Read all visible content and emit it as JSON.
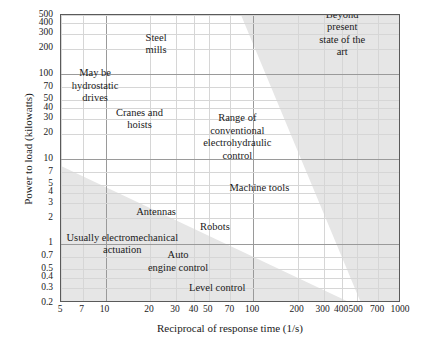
{
  "chart_data": {
    "type": "scatter",
    "title": "",
    "xlabel": "Reciprocal of response time (1/s)",
    "ylabel": "Power to load (kilowatts)",
    "xscale": "log",
    "yscale": "log",
    "xlim": [
      5,
      1000
    ],
    "ylim": [
      0.2,
      500
    ],
    "grid": true,
    "legend": "none",
    "xticks": [
      "5",
      "7",
      "10",
      "20",
      "30",
      "40",
      "50",
      "70",
      "100",
      "200",
      "300",
      "400",
      "500",
      "700",
      "1000"
    ],
    "xtick_values": [
      5,
      7,
      10,
      20,
      30,
      40,
      50,
      70,
      100,
      200,
      300,
      400,
      500,
      700,
      1000
    ],
    "yticks": [
      "500",
      "400",
      "300",
      "200",
      "100",
      "70",
      "50",
      "40",
      "30",
      "20",
      "10",
      "7",
      "5",
      "4",
      "3",
      "2",
      "1",
      "0.7",
      "0.5",
      "0.4",
      "0.3",
      "0.2"
    ],
    "ytick_values": [
      500,
      400,
      300,
      200,
      100,
      70,
      50,
      40,
      30,
      20,
      10,
      7,
      5,
      4,
      3,
      2,
      1,
      0.7,
      0.5,
      0.4,
      0.3,
      0.2
    ],
    "shaded_color": "#e6e6e6",
    "regions": [
      {
        "name": "beyond-present-state-of-the-art",
        "label": "Beyond present\nstate of the art",
        "shaded": true,
        "position": "upper-right",
        "label_x": 400,
        "label_y": 300
      },
      {
        "name": "usually-electromechanical-actuation",
        "label": "Usually electromechanical\nactuation",
        "shaded": true,
        "position": "lower-left",
        "label_x": 13,
        "label_y": 1.0
      }
    ],
    "annotations": [
      {
        "name": "steel-mills",
        "label": "Steel\nmills",
        "x": 22,
        "y": 230
      },
      {
        "name": "may-be-hydrostatic-drives",
        "label": "May be\nhydrostatic\ndrives",
        "x": 8.5,
        "y": 72
      },
      {
        "name": "cranes-and-hoists",
        "label": "Cranes and\nhoists",
        "x": 17,
        "y": 30
      },
      {
        "name": "beyond-present-state",
        "label": "Beyond present\nstate of the art",
        "x": 400,
        "y": 300
      },
      {
        "name": "range-of-conventional-electrohydraulic-control",
        "label": "Range of\nconventional\nelectrohydraulic\ncontrol",
        "x": 78,
        "y": 18
      },
      {
        "name": "machine-tools",
        "label": "Machine tools",
        "x": 110,
        "y": 4.6
      },
      {
        "name": "antennas",
        "label": "Antennas",
        "x": 22,
        "y": 2.4
      },
      {
        "name": "robots",
        "label": "Robots",
        "x": 55,
        "y": 1.6
      },
      {
        "name": "usually-electromechanical-actuation",
        "label": "Usually electromechanical\nactuation",
        "x": 13,
        "y": 1.0
      },
      {
        "name": "auto-engine-control",
        "label": "Auto\nengine control",
        "x": 31,
        "y": 0.62
      },
      {
        "name": "level-control",
        "label": "Level control",
        "x": 57,
        "y": 0.3
      }
    ]
  }
}
